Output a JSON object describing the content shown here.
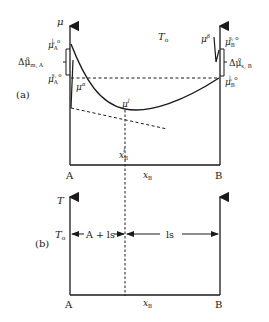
{
  "panel_a": {
    "label": "(a)",
    "y_axis_label": "μ",
    "temperature_label": "T",
    "temperature_sub": "o",
    "left_end_label": "A",
    "right_end_label": "B",
    "x_axis_label": "x",
    "x_axis_sub": "B",
    "mu_A_liquid": {
      "base": "μ",
      "sub": "A",
      "sup": "l, o"
    },
    "mu_A_solid": {
      "base": "μ",
      "sub": "A",
      "sup": "s, o"
    },
    "delta_mu_A": {
      "base": "Δμ",
      "sub": "m, A",
      "sup": "o"
    },
    "mu_B_solid": {
      "base": "μ",
      "sub": "B",
      "sup": "s, o"
    },
    "mu_B_liquid": {
      "base": "μ",
      "sub": "B",
      "sup": "l, o"
    },
    "delta_mu_B": {
      "base": "Δμ",
      "sub": "s, B",
      "sup": "o"
    },
    "mu_alpha": {
      "base": "μ",
      "sup": "α"
    },
    "mu_beta": {
      "base": "μ",
      "sup": "β"
    },
    "mu_l": {
      "base": "μ",
      "sup": "l"
    },
    "x_B_l": {
      "base": "x",
      "sub": "B",
      "sup": "l"
    }
  },
  "panel_b": {
    "label": "(b)",
    "y_axis_label": "T",
    "temperature_label": "T",
    "temperature_sub": "o",
    "region_left": "A + ls",
    "region_right": "ls",
    "left_end_label": "A",
    "right_end_label": "B",
    "x_axis_label": "x",
    "x_axis_sub": "B"
  },
  "colors": {
    "line": "#1a1a1a",
    "background": "#ffffff"
  }
}
